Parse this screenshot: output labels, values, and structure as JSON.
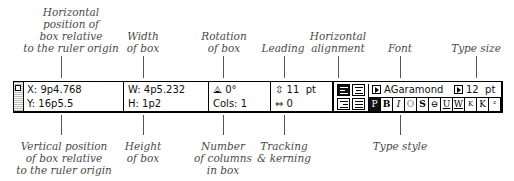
{
  "callouts_top": [
    {
      "id": "x-pos",
      "text": "Horizontal\nposition of\nbox relative\nto the ruler origin"
    },
    {
      "id": "width",
      "text": "Width\nof box"
    },
    {
      "id": "rotation",
      "text": "Rotation\nof box"
    },
    {
      "id": "leading",
      "text": "Leading"
    },
    {
      "id": "halign",
      "text": "Horizontal\nalignment"
    },
    {
      "id": "font",
      "text": "Font"
    },
    {
      "id": "typesize",
      "text": "Type size"
    }
  ],
  "callouts_bottom": [
    {
      "id": "y-pos",
      "text": "Vertical position\nof box relative\nto the ruler origin"
    },
    {
      "id": "height",
      "text": "Height\nof box"
    },
    {
      "id": "columns",
      "text": "Number\nof columns\nin box"
    },
    {
      "id": "tracking",
      "text": "Tracking\n& kerning"
    },
    {
      "id": "typestyle",
      "text": "Type style"
    }
  ],
  "palette": {
    "x": "X: 9p4.768",
    "y": "Y: 16p5.5",
    "w": "W: 4p5.232",
    "h": "H: 1p2",
    "rotation": "0°",
    "cols": "Cols: 1",
    "leading": "11  pt",
    "tracking": "0",
    "font": "AGaramond",
    "size": "12  pt",
    "styles": [
      "P",
      "B",
      "I",
      "O",
      "S",
      "⊖",
      "U",
      "W",
      "K",
      "K",
      "²",
      "₂",
      "²"
    ]
  }
}
